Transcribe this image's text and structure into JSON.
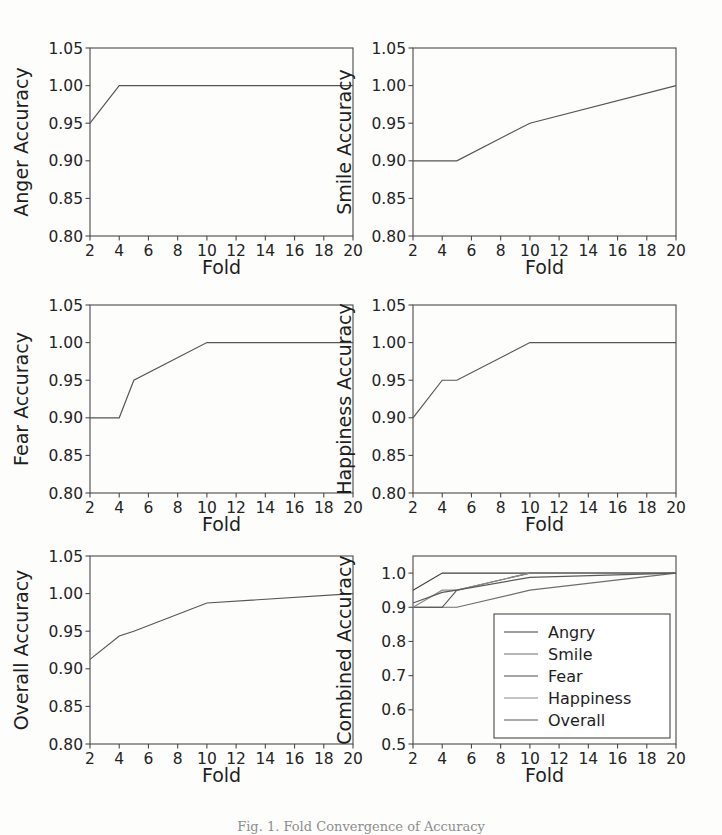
{
  "figure": {
    "caption": "Fig. 1. Fold Convergence of Accuracy",
    "background_color": "#fdfdfc",
    "line_color": "#555555",
    "axis_color": "#4a4a4a",
    "rows": 3,
    "cols": 2
  },
  "axis_titles": {
    "x": "Fold"
  },
  "legend": {
    "position": "lower-right",
    "entries": [
      {
        "label": "Angry",
        "color": "#3f3f3f"
      },
      {
        "label": "Smile",
        "color": "#6e6e6e"
      },
      {
        "label": "Fear",
        "color": "#4d4d4d"
      },
      {
        "label": "Happiness",
        "color": "#8a8a8a"
      },
      {
        "label": "Overall",
        "color": "#5a5a5a"
      }
    ]
  },
  "chart_data": [
    {
      "id": "anger",
      "type": "line",
      "title": "",
      "xlabel": "Fold",
      "ylabel": "Anger Accuracy",
      "xlim": [
        2,
        20
      ],
      "ylim": [
        0.8,
        1.05
      ],
      "xticks": [
        2,
        4,
        6,
        8,
        10,
        12,
        14,
        16,
        18,
        20
      ],
      "yticks": [
        0.8,
        0.85,
        0.9,
        0.95,
        1.0,
        1.05
      ],
      "ytick_labels": [
        "0.80",
        "0.85",
        "0.90",
        "0.95",
        "1.00",
        "1.05"
      ],
      "grid": false,
      "series": [
        {
          "name": "Angry",
          "color": "#555555",
          "x": [
            2,
            4,
            5,
            10,
            20
          ],
          "values": [
            0.95,
            1.0,
            1.0,
            1.0,
            1.0
          ]
        }
      ]
    },
    {
      "id": "smile",
      "type": "line",
      "title": "",
      "xlabel": "Fold",
      "ylabel": "Smile Accuracy",
      "xlim": [
        2,
        20
      ],
      "ylim": [
        0.8,
        1.05
      ],
      "xticks": [
        2,
        4,
        6,
        8,
        10,
        12,
        14,
        16,
        18,
        20
      ],
      "yticks": [
        0.8,
        0.85,
        0.9,
        0.95,
        1.0,
        1.05
      ],
      "ytick_labels": [
        "0.80",
        "0.85",
        "0.90",
        "0.95",
        "1.00",
        "1.05"
      ],
      "grid": false,
      "series": [
        {
          "name": "Smile",
          "color": "#555555",
          "x": [
            2,
            4,
            5,
            10,
            20
          ],
          "values": [
            0.9,
            0.9,
            0.9,
            0.95,
            1.0
          ]
        }
      ]
    },
    {
      "id": "fear",
      "type": "line",
      "title": "",
      "xlabel": "Fold",
      "ylabel": "Fear Accuracy",
      "xlim": [
        2,
        20
      ],
      "ylim": [
        0.8,
        1.05
      ],
      "xticks": [
        2,
        4,
        6,
        8,
        10,
        12,
        14,
        16,
        18,
        20
      ],
      "yticks": [
        0.8,
        0.85,
        0.9,
        0.95,
        1.0,
        1.05
      ],
      "ytick_labels": [
        "0.80",
        "0.85",
        "0.90",
        "0.95",
        "1.00",
        "1.05"
      ],
      "grid": false,
      "series": [
        {
          "name": "Fear",
          "color": "#555555",
          "x": [
            2,
            4,
            5,
            10,
            20
          ],
          "values": [
            0.9,
            0.9,
            0.95,
            1.0,
            1.0
          ]
        }
      ]
    },
    {
      "id": "happiness",
      "type": "line",
      "title": "",
      "xlabel": "Fold",
      "ylabel": "Happiness Accuracy",
      "xlim": [
        2,
        20
      ],
      "ylim": [
        0.8,
        1.05
      ],
      "xticks": [
        2,
        4,
        6,
        8,
        10,
        12,
        14,
        16,
        18,
        20
      ],
      "yticks": [
        0.8,
        0.85,
        0.9,
        0.95,
        1.0,
        1.05
      ],
      "ytick_labels": [
        "0.80",
        "0.85",
        "0.90",
        "0.95",
        "1.00",
        "1.05"
      ],
      "grid": false,
      "series": [
        {
          "name": "Happiness",
          "color": "#555555",
          "x": [
            2,
            4,
            5,
            10,
            20
          ],
          "values": [
            0.9,
            0.95,
            0.95,
            1.0,
            1.0
          ]
        }
      ]
    },
    {
      "id": "overall",
      "type": "line",
      "title": "",
      "xlabel": "Fold",
      "ylabel": "Overall Accuracy",
      "xlim": [
        2,
        20
      ],
      "ylim": [
        0.8,
        1.05
      ],
      "xticks": [
        2,
        4,
        6,
        8,
        10,
        12,
        14,
        16,
        18,
        20
      ],
      "yticks": [
        0.8,
        0.85,
        0.9,
        0.95,
        1.0,
        1.05
      ],
      "ytick_labels": [
        "0.80",
        "0.85",
        "0.90",
        "0.95",
        "1.00",
        "1.05"
      ],
      "grid": false,
      "series": [
        {
          "name": "Overall",
          "color": "#555555",
          "x": [
            2,
            4,
            5,
            10,
            20
          ],
          "values": [
            0.9125,
            0.9437,
            0.95,
            0.9875,
            1.0
          ]
        }
      ]
    },
    {
      "id": "combined",
      "type": "line",
      "title": "",
      "xlabel": "Fold",
      "ylabel": "Combined Accuracy",
      "xlim": [
        2,
        20
      ],
      "ylim": [
        0.5,
        1.05
      ],
      "xticks": [
        2,
        4,
        6,
        8,
        10,
        12,
        14,
        16,
        18,
        20
      ],
      "yticks": [
        0.5,
        0.6,
        0.7,
        0.8,
        0.9,
        1.0
      ],
      "ytick_labels": [
        "0.5",
        "0.6",
        "0.7",
        "0.8",
        "0.9",
        "1.0"
      ],
      "grid": false,
      "has_legend": true,
      "series": [
        {
          "name": "Angry",
          "color": "#3f3f3f",
          "x": [
            2,
            4,
            5,
            10,
            20
          ],
          "values": [
            0.95,
            1.0,
            1.0,
            1.0,
            1.0
          ]
        },
        {
          "name": "Smile",
          "color": "#6e6e6e",
          "x": [
            2,
            4,
            5,
            10,
            20
          ],
          "values": [
            0.9,
            0.9,
            0.9,
            0.95,
            1.0
          ]
        },
        {
          "name": "Fear",
          "color": "#4d4d4d",
          "x": [
            2,
            4,
            5,
            10,
            20
          ],
          "values": [
            0.9,
            0.9,
            0.95,
            1.0,
            1.0
          ]
        },
        {
          "name": "Happiness",
          "color": "#8a8a8a",
          "x": [
            2,
            4,
            5,
            10,
            20
          ],
          "values": [
            0.9,
            0.95,
            0.95,
            1.0,
            1.0
          ]
        },
        {
          "name": "Overall",
          "color": "#5a5a5a",
          "x": [
            2,
            4,
            5,
            10,
            20
          ],
          "values": [
            0.9125,
            0.9437,
            0.95,
            0.9875,
            1.0
          ]
        }
      ]
    }
  ]
}
